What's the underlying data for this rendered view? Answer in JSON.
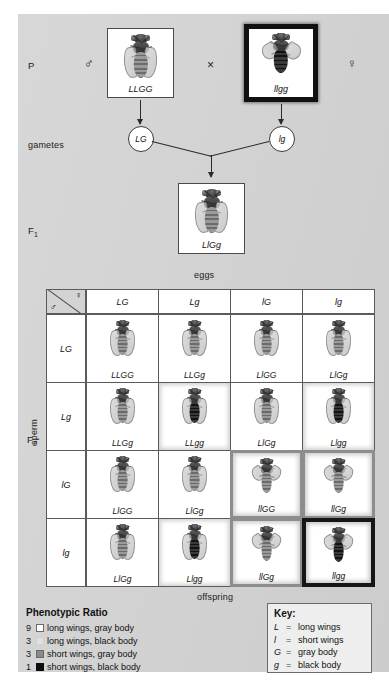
{
  "figure": {
    "background": "#d3d3d3",
    "generations": {
      "p_label": "P",
      "gametes_label": "gametes",
      "f1_label": "F",
      "f1_sub": "1",
      "f2_label": "F",
      "f2_sub": "2"
    },
    "cross_symbol": "×",
    "male_symbol": "♂",
    "female_symbol": "♀"
  },
  "parents": {
    "male": {
      "genotype": "LLGG",
      "wings": "long",
      "body": "gray",
      "border": "thin",
      "sex": "♂"
    },
    "female": {
      "genotype": "llgg",
      "wings": "short",
      "body": "black",
      "border": "thick",
      "sex": "♀"
    }
  },
  "gametes": {
    "male_gamete": "LG",
    "female_gamete": "lg"
  },
  "f1": {
    "genotype": "LlGg",
    "wings": "long",
    "body": "gray"
  },
  "punnett": {
    "top_axis_label": "eggs",
    "bottom_axis_label": "offspring",
    "left_axis_label": "sperm",
    "column_headers": [
      "LG",
      "Lg",
      "lG",
      "lg"
    ],
    "row_headers": [
      "LG",
      "Lg",
      "lG",
      "lg"
    ],
    "cells": [
      [
        {
          "genotype": "LLGG",
          "wings": "long",
          "body": "gray",
          "phenotype": "long-gray"
        },
        {
          "genotype": "LLGg",
          "wings": "long",
          "body": "gray",
          "phenotype": "long-gray"
        },
        {
          "genotype": "LlGG",
          "wings": "long",
          "body": "gray",
          "phenotype": "long-gray"
        },
        {
          "genotype": "LlGg",
          "wings": "long",
          "body": "gray",
          "phenotype": "long-gray"
        }
      ],
      [
        {
          "genotype": "LLGg",
          "wings": "long",
          "body": "gray",
          "phenotype": "long-gray"
        },
        {
          "genotype": "LLgg",
          "wings": "long",
          "body": "black",
          "phenotype": "long-black"
        },
        {
          "genotype": "LlGg",
          "wings": "long",
          "body": "gray",
          "phenotype": "long-gray"
        },
        {
          "genotype": "Llgg",
          "wings": "long",
          "body": "black",
          "phenotype": "long-black"
        }
      ],
      [
        {
          "genotype": "LlGG",
          "wings": "long",
          "body": "gray",
          "phenotype": "long-gray"
        },
        {
          "genotype": "LlGg",
          "wings": "long",
          "body": "gray",
          "phenotype": "long-gray"
        },
        {
          "genotype": "llGG",
          "wings": "short",
          "body": "gray",
          "phenotype": "short-gray"
        },
        {
          "genotype": "llGg",
          "wings": "short",
          "body": "gray",
          "phenotype": "short-gray"
        }
      ],
      [
        {
          "genotype": "LlGg",
          "wings": "long",
          "body": "gray",
          "phenotype": "long-gray"
        },
        {
          "genotype": "Llgg",
          "wings": "long",
          "body": "black",
          "phenotype": "long-black"
        },
        {
          "genotype": "llGg",
          "wings": "short",
          "body": "gray",
          "phenotype": "short-gray"
        },
        {
          "genotype": "llgg",
          "wings": "short",
          "body": "black",
          "phenotype": "short-black"
        }
      ]
    ]
  },
  "phenotypic_ratio": {
    "title": "Phenotypic Ratio",
    "rows": [
      {
        "count": "9",
        "swatch": "long-gray",
        "label": "long wings, gray body"
      },
      {
        "count": "3",
        "swatch": "long-black",
        "label": "long wings, black body"
      },
      {
        "count": "3",
        "swatch": "short-gray",
        "label": "short wings, gray body"
      },
      {
        "count": "1",
        "swatch": "short-black",
        "label": "short wings, black body"
      }
    ]
  },
  "key": {
    "title": "Key:",
    "equals": "=",
    "entries": [
      {
        "symbol": "L",
        "meaning": "long wings"
      },
      {
        "symbol": "l",
        "meaning": "short wings"
      },
      {
        "symbol": "G",
        "meaning": "gray body"
      },
      {
        "symbol": "g",
        "meaning": "black body"
      }
    ]
  },
  "chart_data": {
    "type": "table",
    "categories": [
      "long wings, gray body",
      "long wings, black body",
      "short wings, gray body",
      "short wings, black body"
    ],
    "values": [
      9,
      3,
      3,
      1
    ],
    "xlabel": "phenotype",
    "ylabel": "count out of 16"
  }
}
